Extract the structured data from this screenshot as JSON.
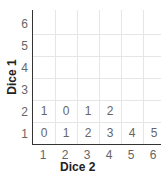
{
  "chart_data": {
    "type": "table",
    "title": "",
    "xlabel": "Dice 2",
    "ylabel": "Dice 1",
    "x_ticks": [
      "1",
      "2",
      "3",
      "4",
      "5",
      "6"
    ],
    "y_ticks": [
      "1",
      "2",
      "3",
      "4",
      "5",
      "6"
    ],
    "grid": true,
    "rows": [
      {
        "dice1": 1,
        "values": [
          "0",
          "1",
          "2",
          "3",
          "4",
          "5"
        ]
      },
      {
        "dice1": 2,
        "values": [
          "1",
          "0",
          "1",
          "2",
          "",
          ""
        ]
      }
    ]
  }
}
